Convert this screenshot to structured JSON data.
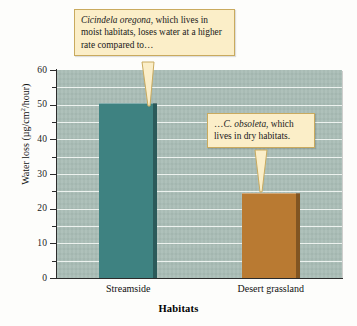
{
  "figure": {
    "background_color": "#fdfdfb",
    "plot_background_color": "#a9bdb6",
    "gridline_color": "#f2f6f3"
  },
  "chart_data": {
    "type": "bar",
    "title": "",
    "xlabel": "Habitats",
    "ylabel": "Water loss (µg/cm²/hour)",
    "categories": [
      "Streamside",
      "Desert grassland"
    ],
    "values": [
      50.5,
      24.5
    ],
    "bar_colors": [
      "#3e8281",
      "#b97a32"
    ],
    "ylim": [
      0,
      60
    ],
    "ytick_major": [
      0,
      10,
      20,
      30,
      40,
      50,
      60
    ],
    "ytick_major_labels": [
      "0",
      "10",
      "20",
      "30",
      "40",
      "50",
      "60"
    ],
    "ytick_minor": [
      5,
      15,
      25,
      35,
      45,
      55
    ],
    "gridlines": [
      5,
      10,
      15,
      20,
      25,
      30,
      35,
      40,
      45,
      50,
      55
    ],
    "grid": true,
    "legend": null,
    "annotations": [
      {
        "id": "callout-streamside",
        "text_parts": [
          {
            "text": "Cicindela oregona",
            "style": "italic"
          },
          {
            "text": ", which lives in moist habitats, loses water at a higher rate compared to…",
            "style": "normal"
          }
        ],
        "plain_text": "Cicindela oregona, which lives in moist habitats, loses water at a higher rate compared to…",
        "points_to": "Streamside"
      },
      {
        "id": "callout-desert",
        "text_parts": [
          {
            "text": "…",
            "style": "normal"
          },
          {
            "text": "C. obsoleta",
            "style": "italic"
          },
          {
            "text": ", which lives in dry habitats.",
            "style": "normal"
          }
        ],
        "plain_text": "…C. obsoleta, which lives in dry habitats.",
        "points_to": "Desert grassland"
      }
    ]
  },
  "callouts": {
    "first": {
      "line1_italic": "Cicindela oregona",
      "line1_rest": ", which lives",
      "line2": "in moist habitats, loses water at",
      "line3": "a higher rate compared to…"
    },
    "second": {
      "line1_lead": "…",
      "line1_italic": "C. obsoleta",
      "line1_rest": ", which",
      "line2": "lives in dry habitats."
    }
  },
  "axis": {
    "y_title_main": "Water loss (µg/cm",
    "y_title_sup": "2",
    "y_title_tail": "/hour)",
    "x_title": "Habitats"
  }
}
